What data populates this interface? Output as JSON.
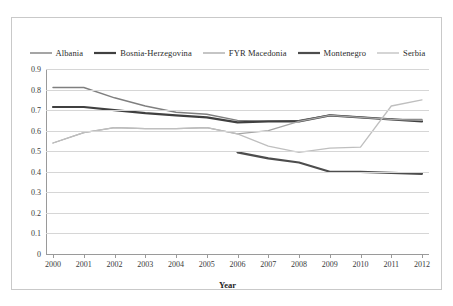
{
  "chart_data": {
    "type": "line",
    "title": "",
    "xlabel": "Year",
    "ylabel": "",
    "x": [
      2000,
      2001,
      2002,
      2003,
      2004,
      2005,
      2006,
      2007,
      2008,
      2009,
      2010,
      2011,
      2012
    ],
    "xtick_labels": [
      "2000",
      "2001",
      "2002",
      "2003",
      "2004",
      "2005",
      "2006",
      "2007",
      "2008",
      "2009",
      "2010",
      "2011",
      "2012"
    ],
    "ytick_labels": [
      "0",
      "0.1",
      "0.2",
      "0.3",
      "0.4",
      "0.5",
      "0.6",
      "0.7",
      "0.8",
      "0.9"
    ],
    "ylim": [
      0,
      0.9
    ],
    "ytick_step": 0.1,
    "grid": true,
    "legend_position": "top",
    "series": [
      {
        "name": "Albania",
        "color": "#7f7f7f",
        "width": 1.4,
        "values": [
          0.81,
          0.81,
          0.76,
          0.72,
          0.69,
          0.68,
          0.65,
          0.645,
          0.65,
          0.675,
          0.665,
          0.655,
          0.655
        ]
      },
      {
        "name": "Bosnia-Herzegovina",
        "color": "#404040",
        "width": 2.2,
        "values": [
          0.715,
          0.715,
          0.7,
          0.685,
          0.675,
          0.665,
          0.64,
          0.645,
          0.645,
          0.675,
          0.665,
          0.655,
          0.645
        ]
      },
      {
        "name": "FYR Macedonia",
        "color": "#a6a6a6",
        "width": 1.3,
        "values": [
          0.54,
          0.59,
          0.615,
          0.61,
          0.61,
          0.615,
          0.585,
          0.6,
          0.645,
          0.675,
          0.665,
          0.655,
          0.65
        ]
      },
      {
        "name": "Montenegro",
        "color": "#4d4d4d",
        "width": 2.2,
        "values": [
          null,
          null,
          null,
          null,
          null,
          null,
          0.495,
          0.465,
          0.445,
          0.4,
          0.4,
          0.395,
          0.39
        ]
      },
      {
        "name": "Serbia",
        "color": "#bfbfbf",
        "width": 1.3,
        "values": [
          0.54,
          0.59,
          0.615,
          0.61,
          0.61,
          0.615,
          0.585,
          0.525,
          0.495,
          0.515,
          0.52,
          0.72,
          0.75
        ]
      }
    ]
  },
  "legend": {
    "items": [
      {
        "label": "Albania"
      },
      {
        "label": "Bosnia-Herzegovina"
      },
      {
        "label": "FYR Macedonia"
      },
      {
        "label": "Montenegro"
      },
      {
        "label": "Serbia"
      }
    ]
  },
  "axis": {
    "x_title": "Year"
  }
}
